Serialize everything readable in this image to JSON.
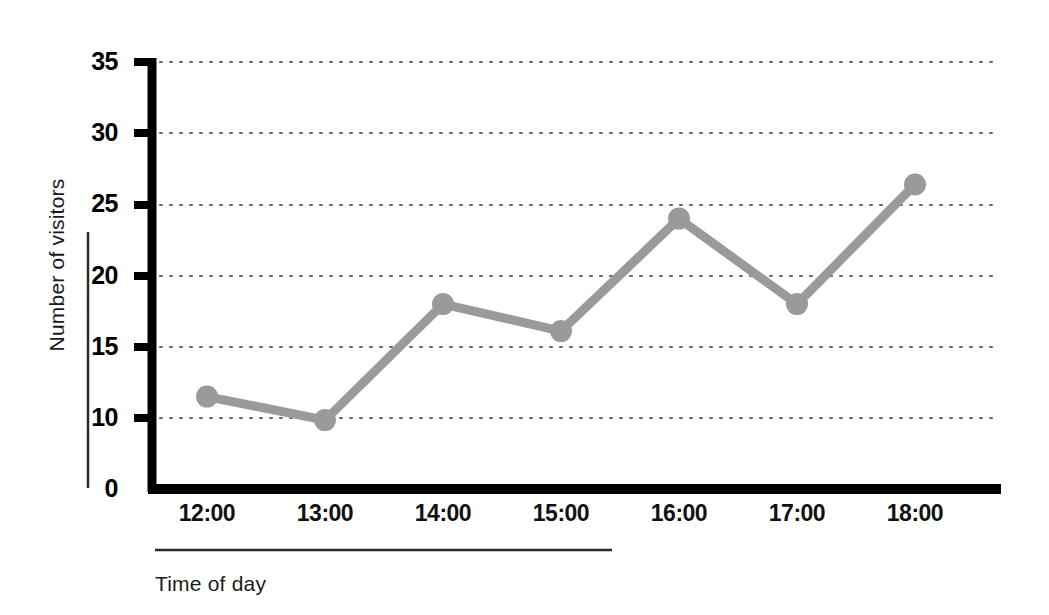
{
  "chart_data": {
    "type": "line",
    "title": "",
    "subtitle": "",
    "xlabel": "Time of day",
    "ylabel": "Number of visitors",
    "categories": [
      "12:00",
      "13:00",
      "14:00",
      "15:00",
      "16:00",
      "17:00",
      "18:00"
    ],
    "series": [
      {
        "name": "Visitors",
        "color": "#999999",
        "values": [
          11.5,
          9.7,
          18.0,
          16.1,
          24.0,
          18.0,
          26.4
        ]
      }
    ],
    "x": [
      "12:00",
      "13:00",
      "14:00",
      "15:00",
      "16:00",
      "17:00",
      "18:00"
    ],
    "values": [
      11.5,
      9.7,
      18.0,
      16.1,
      24.0,
      18.0,
      26.4
    ],
    "ylim": [
      0,
      35
    ],
    "ytick_labels": [
      "0",
      "10",
      "15",
      "20",
      "25",
      "30",
      "35"
    ],
    "ytick_values": [
      0,
      10,
      15,
      20,
      25,
      30,
      35
    ],
    "gridline_values": [
      10,
      15,
      20,
      25,
      30,
      35
    ],
    "grid": true,
    "grid_style": "dotted-horizontal",
    "legend": "none",
    "legend_position": "none",
    "axis_color": "#000000",
    "grid_color": "#6b6b6b",
    "line_color": "#999999",
    "marker_color": "#9a9a9a",
    "background_color": "#ffffff",
    "note_axis_break": "y-axis labels jump from 0 to 10 (no tick at 5)"
  },
  "labels": {
    "y_axis_title": "Number of visitors",
    "x_axis_title": "Time of day"
  }
}
